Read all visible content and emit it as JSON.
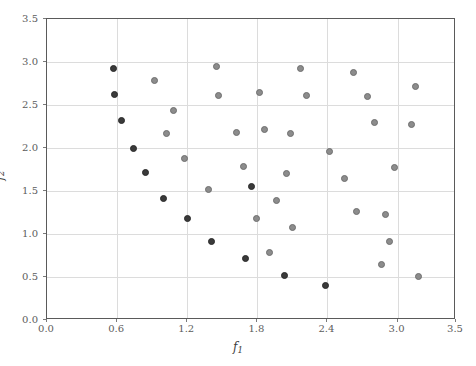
{
  "chart_data": {
    "type": "scatter",
    "title": "",
    "xlabel": "f1",
    "ylabel": "f2",
    "xlabel_display": "f",
    "xlabel_sub": "1",
    "ylabel_display": "f",
    "ylabel_sub": "2",
    "xlim": [
      0.0,
      3.5
    ],
    "ylim": [
      0.0,
      3.5
    ],
    "xticks": [
      0.0,
      0.6,
      1.2,
      1.8,
      2.4,
      3.0,
      3.5
    ],
    "xtick_labels": [
      "0.0",
      "0.6",
      "1.2",
      "1.8",
      "2.4",
      "3.0",
      "3.5"
    ],
    "yticks": [
      0.0,
      0.5,
      1.0,
      1.5,
      2.0,
      2.5,
      3.0,
      3.5
    ],
    "ytick_labels": [
      "0.0",
      "0.5",
      "1.0",
      "1.5",
      "2.0",
      "2.5",
      "3.0",
      "3.5"
    ],
    "grid": true,
    "legend": "none",
    "marker": "circle",
    "marker_size": 7,
    "colors": {
      "dark_marker": "#3a3a3a",
      "light_marker": "#8c8c8c",
      "gridline": "#dcdcdc",
      "axis": "#5a5a5a",
      "tick_text": "#5c5c5c",
      "background": "#ffffff"
    },
    "series": [
      {
        "name": "dark",
        "color": "#3a3a3a",
        "points": [
          [
            0.57,
            2.93
          ],
          [
            0.58,
            2.62
          ],
          [
            0.64,
            2.32
          ],
          [
            0.74,
            2.0
          ],
          [
            0.84,
            1.71
          ],
          [
            1.0,
            1.41
          ],
          [
            1.2,
            1.18
          ],
          [
            1.41,
            0.91
          ],
          [
            1.7,
            0.71
          ],
          [
            1.75,
            1.55
          ],
          [
            2.03,
            0.52
          ],
          [
            2.38,
            0.4
          ]
        ]
      },
      {
        "name": "light",
        "color": "#8c8c8c",
        "points": [
          [
            0.92,
            2.78
          ],
          [
            1.02,
            2.17
          ],
          [
            1.08,
            2.44
          ],
          [
            1.18,
            1.88
          ],
          [
            1.38,
            1.52
          ],
          [
            1.45,
            2.95
          ],
          [
            1.47,
            2.61
          ],
          [
            1.62,
            2.18
          ],
          [
            1.68,
            1.78
          ],
          [
            1.79,
            1.18
          ],
          [
            1.82,
            2.64
          ],
          [
            1.86,
            2.21
          ],
          [
            1.9,
            0.79
          ],
          [
            1.96,
            1.39
          ],
          [
            2.05,
            1.7
          ],
          [
            2.08,
            2.17
          ],
          [
            2.1,
            1.08
          ],
          [
            2.17,
            2.92
          ],
          [
            2.22,
            2.61
          ],
          [
            2.42,
            1.96
          ],
          [
            2.55,
            1.65
          ],
          [
            2.62,
            2.88
          ],
          [
            2.65,
            1.26
          ],
          [
            2.74,
            2.6
          ],
          [
            2.8,
            2.3
          ],
          [
            2.86,
            0.65
          ],
          [
            2.9,
            1.23
          ],
          [
            2.93,
            0.91
          ],
          [
            2.97,
            1.77
          ],
          [
            3.12,
            2.27
          ],
          [
            3.15,
            2.71
          ],
          [
            3.18,
            0.51
          ]
        ]
      }
    ]
  }
}
